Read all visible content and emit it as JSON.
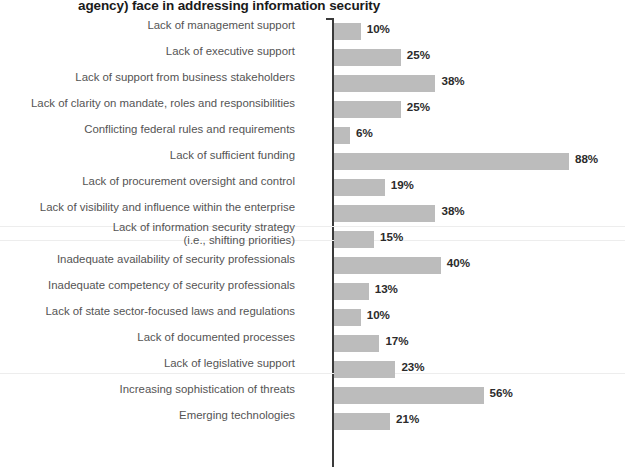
{
  "title": "agency) face in addressing information security",
  "colors": {
    "bar": "#bcbcbc",
    "axis": "#3a3a3a",
    "label_text": "#545454",
    "value_text": "#2b2b2b",
    "title_text": "#1a1a1a",
    "background": "#ffffff"
  },
  "chart_data": {
    "type": "bar",
    "orientation": "horizontal",
    "title": "agency) face in addressing information security",
    "xlabel": "",
    "ylabel": "",
    "xlim": [
      0,
      100
    ],
    "grid": false,
    "legend": null,
    "value_suffix": "%",
    "categories": [
      "Lack of management support",
      "Lack of executive support",
      "Lack of support from business stakeholders",
      "Lack of clarity on mandate, roles and responsibilities",
      "Conflicting federal rules and requirements",
      "Lack of sufficient funding",
      "Lack of procurement oversight and control",
      "Lack of visibility and influence within the enterprise",
      "Lack of information security strategy\n(i.e., shifting priorities)",
      "Inadequate availability of security professionals",
      "Inadequate competency of security professionals",
      "Lack of state sector-focused laws and regulations",
      "Lack of documented processes",
      "Lack of legislative support",
      "Increasing sophistication of threats",
      "Emerging technologies"
    ],
    "values": [
      10,
      25,
      38,
      25,
      6,
      88,
      19,
      38,
      15,
      40,
      13,
      10,
      17,
      23,
      56,
      21
    ],
    "labels": [
      "10%",
      "25%",
      "38%",
      "25%",
      "6%",
      "88%",
      "19%",
      "38%",
      "15%",
      "40%",
      "13%",
      "10%",
      "17%",
      "23%",
      "56%",
      "21%"
    ]
  }
}
